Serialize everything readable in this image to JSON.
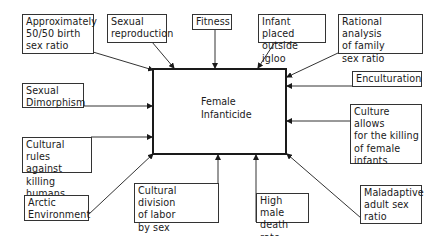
{
  "diagram": {
    "center": {
      "label": "Female\nInfanticide"
    },
    "factors": [
      {
        "id": "birth-sex-ratio",
        "label": "Approximately\n50/50 birth\nsex ratio"
      },
      {
        "id": "sexual-reproduction",
        "label": "Sexual\nreproduction"
      },
      {
        "id": "fitness",
        "label": "Fitness"
      },
      {
        "id": "infant-outside-igloo",
        "label": "Infant placed\noutside igloo"
      },
      {
        "id": "rational-analysis",
        "label": "Rational analysis\nof family\nsex ratio"
      },
      {
        "id": "enculturation",
        "label": "Enculturation"
      },
      {
        "id": "sexual-dimorphism",
        "label": "Sexual\nDimorphism"
      },
      {
        "id": "culture-allows-killing",
        "label": "Culture allows\nfor the killing\nof female\ninfants"
      },
      {
        "id": "cultural-rules",
        "label": "Cultural rules\nagainst killing\nhumans"
      },
      {
        "id": "arctic-environment",
        "label": "Arctic\nEnvironment"
      },
      {
        "id": "division-of-labor",
        "label": "Cultural division\nof labor\nby sex"
      },
      {
        "id": "high-male-death-rate",
        "label": "High male\ndeath rate"
      },
      {
        "id": "maladaptive-sex-ratio",
        "label": "Maladaptive\nadult sex\nratio"
      }
    ]
  }
}
